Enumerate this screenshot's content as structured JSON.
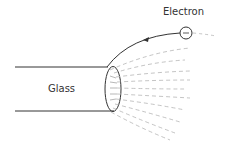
{
  "labels": {
    "electron": "Electron",
    "glass": "Glass"
  },
  "colors": {
    "stroke": "#333333",
    "field_lines": "#aaaaaa",
    "background": "#ffffff"
  },
  "figure": {
    "elements": [
      "glass-rod",
      "rod-end-ellipse",
      "electron-circle",
      "electron-trajectory",
      "field-lines"
    ]
  }
}
